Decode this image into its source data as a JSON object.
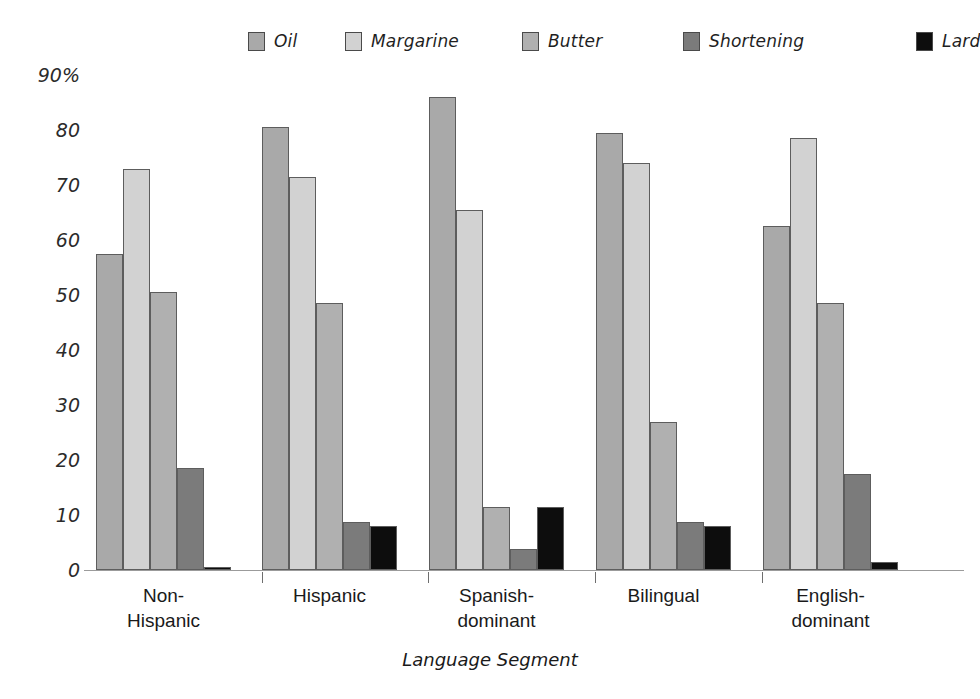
{
  "chart_data": {
    "type": "bar",
    "title": "",
    "xlabel": "Language Segment",
    "ylabel": "",
    "ylim": [
      0,
      90
    ],
    "yticks": [
      0,
      10,
      20,
      30,
      40,
      50,
      60,
      70,
      80,
      90
    ],
    "ytick_labels": [
      "0",
      "10",
      "20",
      "30",
      "40",
      "50",
      "60",
      "70",
      "80",
      "90%"
    ],
    "grid": false,
    "legend_position": "top",
    "categories": [
      "Non-Hispanic",
      "Hispanic",
      "Spanish-dominant",
      "Bilingual",
      "English-dominant"
    ],
    "category_labels": [
      "Non-\nHispanic",
      "Hispanic",
      "Spanish-\ndominant",
      "Bilingual",
      "English-\ndominant"
    ],
    "series": [
      {
        "name": "Oil",
        "color": "#a9a9a9",
        "values": [
          57.5,
          80.5,
          86.0,
          79.5,
          62.5
        ]
      },
      {
        "name": "Margarine",
        "color": "#d2d2d2",
        "values": [
          73.0,
          71.5,
          65.5,
          74.0,
          78.5
        ]
      },
      {
        "name": "Butter",
        "color": "#b0b0b0",
        "values": [
          50.5,
          48.5,
          11.5,
          27.0,
          48.5
        ]
      },
      {
        "name": "Shortening",
        "color": "#7b7b7b",
        "values": [
          18.5,
          8.8,
          3.8,
          8.8,
          17.5
        ]
      },
      {
        "name": "Lard",
        "color": "#0d0d0d",
        "values": [
          0.5,
          8.0,
          11.5,
          8.0,
          1.5
        ]
      }
    ]
  },
  "legend": {
    "items": [
      {
        "label": "Oil",
        "color": "#a9a9a9"
      },
      {
        "label": "Margarine",
        "color": "#d2d2d2"
      },
      {
        "label": "Butter",
        "color": "#b0b0b0"
      },
      {
        "label": "Shortening",
        "color": "#7b7b7b"
      },
      {
        "label": "Lard",
        "color": "#0d0d0d"
      }
    ]
  },
  "axes": {
    "x_title": "Language Segment"
  }
}
